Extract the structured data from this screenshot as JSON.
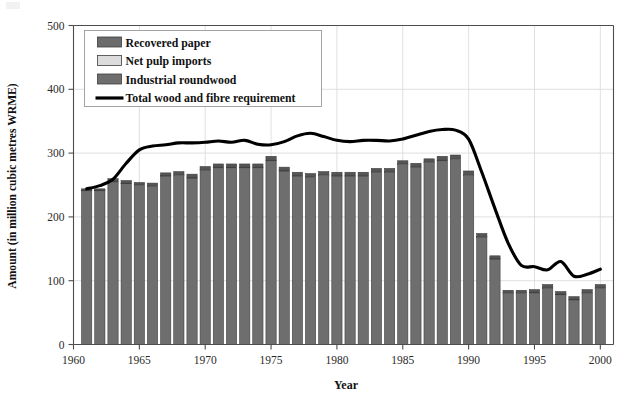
{
  "chart_data": {
    "type": "bar",
    "title": "",
    "xlabel": "Year",
    "ylabel": "Amount (in million cubic metres WRME)",
    "ylim": [
      0,
      500
    ],
    "xlim": [
      1960,
      2001
    ],
    "yticks": [
      0,
      100,
      200,
      300,
      400,
      500
    ],
    "xticks": [
      1960,
      1965,
      1970,
      1975,
      1980,
      1985,
      1990,
      1995,
      2000
    ],
    "grid": true,
    "legend_position": "upper-left-inside",
    "stacked": true,
    "categories": [
      1961,
      1962,
      1963,
      1964,
      1965,
      1966,
      1967,
      1968,
      1969,
      1970,
      1971,
      1972,
      1973,
      1974,
      1975,
      1976,
      1977,
      1978,
      1979,
      1980,
      1981,
      1982,
      1983,
      1984,
      1985,
      1986,
      1987,
      1988,
      1989,
      1990,
      1991,
      1992,
      1993,
      1994,
      1995,
      1996,
      1997,
      1998,
      1999,
      2000
    ],
    "series": [
      {
        "name": "Industrial roundwood",
        "color": "#6e6e6e",
        "values": [
          241,
          241,
          255,
          252,
          249,
          248,
          264,
          265,
          261,
          273,
          277,
          277,
          277,
          277,
          288,
          272,
          264,
          262,
          265,
          264,
          264,
          264,
          270,
          270,
          282,
          278,
          285,
          288,
          290,
          265,
          168,
          134,
          80,
          80,
          81,
          88,
          78,
          70,
          80,
          88
        ]
      },
      {
        "name": "Net pulp imports",
        "color": "#d9d9d9",
        "values": [
          1,
          1,
          1,
          1,
          1,
          1,
          1,
          1,
          1,
          1,
          1,
          1,
          1,
          1,
          1,
          1,
          1,
          1,
          1,
          1,
          1,
          1,
          1,
          1,
          1,
          1,
          1,
          1,
          1,
          1,
          1,
          1,
          1,
          1,
          1,
          1,
          1,
          1,
          1,
          1
        ]
      },
      {
        "name": "Recovered paper",
        "color": "#555555",
        "values": [
          2,
          2,
          4,
          4,
          4,
          4,
          4,
          5,
          5,
          5,
          5,
          5,
          5,
          5,
          6,
          5,
          5,
          5,
          5,
          5,
          5,
          5,
          5,
          5,
          5,
          5,
          5,
          6,
          6,
          6,
          5,
          4,
          4,
          4,
          4,
          5,
          4,
          4,
          5,
          5
        ]
      }
    ],
    "line_series": {
      "name": "Total wood and fibre requirement",
      "color": "#000000",
      "x": [
        1961,
        1962,
        1963,
        1964,
        1965,
        1966,
        1967,
        1968,
        1969,
        1970,
        1971,
        1972,
        1973,
        1974,
        1975,
        1976,
        1977,
        1978,
        1979,
        1980,
        1981,
        1982,
        1983,
        1984,
        1985,
        1986,
        1987,
        1988,
        1989,
        1990,
        1991,
        1992,
        1993,
        1994,
        1995,
        1996,
        1997,
        1998,
        1999,
        2000
      ],
      "values": [
        244,
        249,
        259,
        284,
        305,
        311,
        313,
        316,
        316,
        317,
        319,
        317,
        320,
        314,
        313,
        318,
        327,
        331,
        326,
        320,
        318,
        320,
        320,
        319,
        322,
        328,
        334,
        337,
        336,
        322,
        270,
        213,
        159,
        124,
        122,
        117,
        130,
        107,
        110,
        118
      ]
    },
    "legend_entries": [
      {
        "label": "Recovered paper",
        "type": "swatch",
        "color": "#6b6b6b"
      },
      {
        "label": "Net pulp imports",
        "type": "swatch",
        "color": "#dcdcdc"
      },
      {
        "label": "Industrial roundwood",
        "type": "swatch",
        "color": "#6e6e6e"
      },
      {
        "label": "Total wood and fibre requirement",
        "type": "line",
        "color": "#000000"
      }
    ],
    "colors": {
      "background": "#ffffff",
      "axis": "#4d4d4d",
      "grid": "#d8d8d8",
      "bar_main": "#6e6e6e",
      "bar_light": "#d9d9d9",
      "bar_dark": "#555555",
      "line": "#000000",
      "text": "#1a1a1a"
    }
  }
}
